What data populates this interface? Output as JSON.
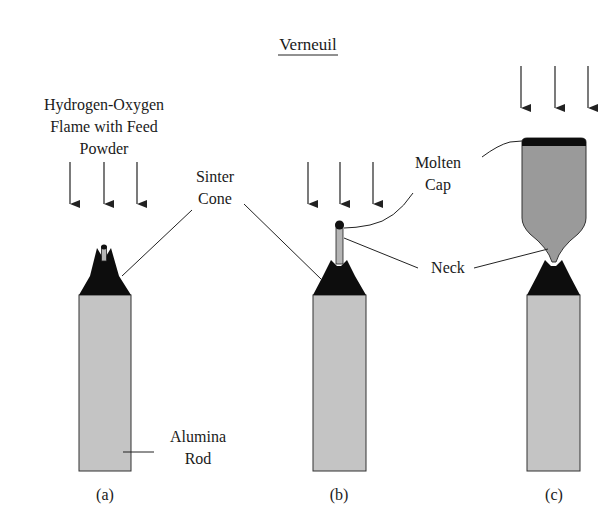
{
  "title": "Verneuil",
  "labels": {
    "flame_line1": "Hydrogen-Oxygen",
    "flame_line2": "Flame with Feed",
    "flame_line3": "Powder",
    "sinter_line1": "Sinter",
    "sinter_line2": "Cone",
    "molten_line1": "Molten",
    "molten_line2": "Cap",
    "neck": "Neck",
    "alumina_line1": "Alumina",
    "alumina_line2": "Rod"
  },
  "panels": [
    {
      "id": "a",
      "caption": "(a)"
    },
    {
      "id": "b",
      "caption": "(b)"
    },
    {
      "id": "c",
      "caption": "(c)"
    }
  ],
  "colors": {
    "rod": "#c4c4c4",
    "cone": "#0d0d0d",
    "crystal": "#9a9a9a",
    "line": "#222222"
  }
}
